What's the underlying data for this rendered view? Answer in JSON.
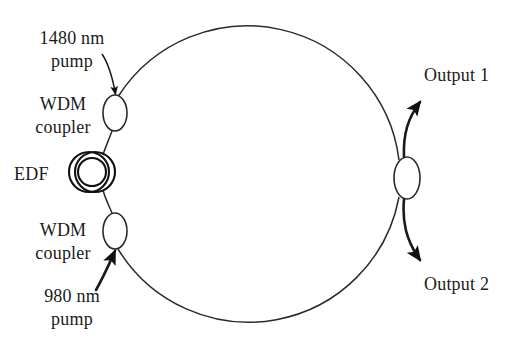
{
  "figure": {
    "stroke_color": "#1a1a1a",
    "background_color": "#ffffff"
  },
  "labels": {
    "pump_1480": "1480 nm\npump",
    "wdm_coupler_top": "WDM\ncoupler",
    "edf": "EDF",
    "wdm_coupler_bottom": "WDM\ncoupler",
    "pump_980": "980 nm\npump",
    "output_1": "Output 1",
    "output_2": "Output 2"
  },
  "components": [
    {
      "name": "wdm-coupler-top",
      "type": "ellipse",
      "cx": 115,
      "cy": 113,
      "rx": 12,
      "ry": 18
    },
    {
      "name": "erbium-doped-fiber",
      "type": "coil",
      "cx": 93,
      "cy": 172,
      "loops": 3
    },
    {
      "name": "wdm-coupler-bottom",
      "type": "ellipse",
      "cx": 115,
      "cy": 231,
      "rx": 12,
      "ry": 18
    },
    {
      "name": "output-coupler",
      "type": "ellipse",
      "cx": 407,
      "cy": 178,
      "rx": 13,
      "ry": 21
    },
    {
      "name": "ring-cavity",
      "type": "circle",
      "cx": 258,
      "cy": 173,
      "r": 153
    }
  ],
  "connections": [
    {
      "name": "pump-1480-input",
      "from": "1480 nm pump",
      "to": "wdm-coupler-top",
      "arrow": true
    },
    {
      "name": "pump-980-input",
      "from": "980 nm pump",
      "to": "wdm-coupler-bottom",
      "arrow": true
    },
    {
      "name": "output-1-arrow",
      "from": "output-coupler",
      "to": "Output 1",
      "arrow": true
    },
    {
      "name": "output-2-arrow",
      "from": "output-coupler",
      "to": "Output 2",
      "arrow": true
    }
  ]
}
